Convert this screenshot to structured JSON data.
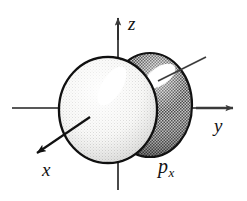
{
  "figure": {
    "background_color": "#ffffff",
    "width": 247,
    "height": 201,
    "axes": [
      {
        "name": "z-axis",
        "label": "z",
        "direction": "up",
        "arrowhead": true,
        "color": "#444444",
        "from": [
          118,
          190
        ],
        "to": [
          118,
          18
        ]
      },
      {
        "name": "y-axis",
        "label": "y",
        "direction": "right",
        "arrowhead": true,
        "color": "#444444",
        "from": [
          12,
          108
        ],
        "to": [
          235,
          108
        ]
      },
      {
        "name": "x-axis",
        "label": "x",
        "direction": "down-left",
        "arrowhead": true,
        "color": "#111111",
        "from": [
          88,
          118
        ],
        "to": [
          38,
          152
        ]
      }
    ],
    "labels": {
      "z": "z",
      "y": "y",
      "x": "x",
      "orbital_main": "p",
      "orbital_sub": "x"
    },
    "lobes": [
      {
        "name": "front-lobe",
        "shading": "light",
        "fill_color": "#f2f2f0",
        "stipple_color": "#b9b9b9",
        "outline_color": "#111111",
        "highlight_color": "#ffffff",
        "center": [
          108,
          110
        ],
        "radius_x": 49,
        "radius_y": 53
      },
      {
        "name": "back-lobe",
        "shading": "dark",
        "fill_color": "#8d8d8d",
        "stipple_color": "#3a3a3a",
        "outline_color": "#111111",
        "highlight_color": "#ffffff",
        "center": [
          150,
          105
        ],
        "radius_x": 42,
        "radius_y": 52
      }
    ],
    "leader_line": {
      "name": "back-lobe-pointer",
      "color": "#3c3c3c",
      "arrowhead": false,
      "from": [
        157,
        80
      ],
      "to": [
        205,
        58
      ]
    }
  }
}
